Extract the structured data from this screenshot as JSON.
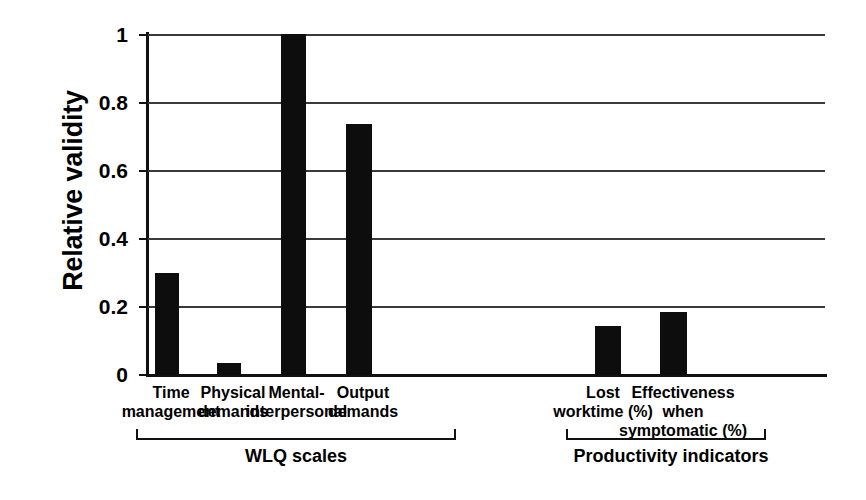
{
  "chart_data": {
    "type": "bar",
    "title": "",
    "subtitle": "",
    "xlabel": "",
    "ylabel": "Relative validity",
    "ylim": [
      0,
      1
    ],
    "yticks": [
      "0",
      "0.2",
      "0.4",
      "0.6",
      "0.8",
      "1"
    ],
    "ytick_values": [
      0,
      0.2,
      0.4,
      0.6,
      0.8,
      1
    ],
    "grid": true,
    "legend": "none",
    "bar_color": "#0d0d0d",
    "categories": [
      "Time management",
      "Physical demands",
      "Mental-interpersonal",
      "Output demands",
      "Lost worktime (%)",
      "Effectiveness when symptomatic (%)"
    ],
    "values": [
      0.3,
      0.035,
      1.0,
      0.735,
      0.143,
      0.185
    ],
    "category_labels": [
      {
        "line1": "Time",
        "line2": "management",
        "line3": ""
      },
      {
        "line1": "Physical",
        "line2": "demands",
        "line3": ""
      },
      {
        "line1": "Mental-",
        "line2": "interpersonal",
        "line3": ""
      },
      {
        "line1": "Output",
        "line2": "demands",
        "line3": ""
      },
      {
        "line1": "Lost",
        "line2": "worktime (%)",
        "line3": ""
      },
      {
        "line1": "Effectiveness",
        "line2": "when",
        "line3": "symptomatic (%)"
      }
    ],
    "groups": [
      {
        "label": "WLQ scales",
        "categories": [
          0,
          1,
          2,
          3
        ]
      },
      {
        "label": "Productivity indicators",
        "categories": [
          4,
          5
        ]
      }
    ]
  },
  "axis": {
    "y_title": "Relative validity",
    "tick_0": "0",
    "tick_1": "0.2",
    "tick_2": "0.4",
    "tick_3": "0.6",
    "tick_4": "0.8",
    "tick_5": "1"
  },
  "xlabels": {
    "cat0": "Time\nmanagement",
    "cat1": "Physical\ndemands",
    "cat2": "Mental-\ninterpersonal",
    "cat3": "Output\ndemands",
    "cat4": "Lost\nworktime (%)",
    "cat5": "Effectiveness\nwhen\nsymptomatic (%)"
  },
  "groups": {
    "left_label": "WLQ scales",
    "right_label": "Productivity indicators"
  }
}
